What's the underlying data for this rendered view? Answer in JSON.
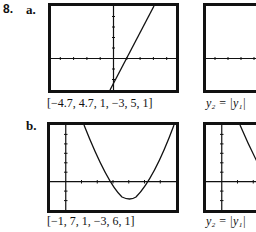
{
  "problem": {
    "number": "8.",
    "parts": [
      {
        "label": "a.",
        "window_caption": "[−4.7, 4.7, 1, −3, 5, 1]",
        "window": {
          "xmin": -4.7,
          "xmax": 4.7,
          "xscl": 1,
          "ymin": -3,
          "ymax": 5,
          "yscl": 1
        },
        "graph1": "linear y1 with positive slope crossing x-axis near x=0.5",
        "graph2_caption": "y₂ = |y₁|"
      },
      {
        "label": "b.",
        "window_caption": "[−1, 7, 1, −3, 6, 1]",
        "window": {
          "xmin": -1,
          "xmax": 7,
          "xscl": 1,
          "ymin": -3,
          "ymax": 6,
          "yscl": 1
        },
        "graph1": "parabola y1 opening upward, vertex near (3.5,-2), roots near 2 and 5",
        "graph2_caption": "y₂ = |y₁|"
      }
    ]
  }
}
